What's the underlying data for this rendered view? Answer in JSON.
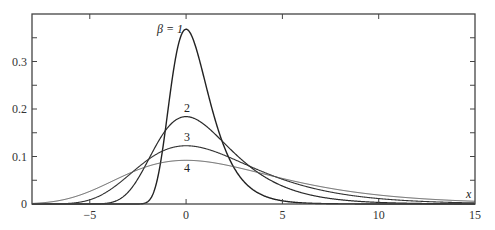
{
  "chart_data": {
    "type": "line",
    "title": "",
    "xlabel": "x",
    "ylabel": "",
    "xlim": [
      -8,
      15
    ],
    "ylim": [
      0,
      0.4
    ],
    "grid": false,
    "x_ticks": [
      -5,
      0,
      5,
      10,
      15
    ],
    "x_tick_labels": [
      "−5",
      "0",
      "5",
      "10",
      "15"
    ],
    "y_ticks": [
      0,
      0.1,
      0.2,
      0.3
    ],
    "y_tick_labels": [
      "0",
      "0.1",
      "0.2",
      "0.3"
    ],
    "y_minor_step": 0.05,
    "function": "Gumbel density f(x) = (1/β) exp(-(x/β) - exp(-x/β))",
    "series": [
      {
        "name": "β = 1",
        "beta": 1,
        "label": "β = 1",
        "peak": 0.368,
        "label_pos": [
          157,
          33
        ],
        "color": "#222222",
        "width": 1.4
      },
      {
        "name": "2",
        "beta": 2,
        "label": "2",
        "peak": 0.184,
        "label_pos": [
          184,
          112
        ],
        "color": "#2a2a2a",
        "width": 1.2
      },
      {
        "name": "3",
        "beta": 3,
        "label": "3",
        "peak": 0.123,
        "label_pos": [
          184,
          141
        ],
        "color": "#333333",
        "width": 1.1
      },
      {
        "name": "4",
        "beta": 4,
        "label": "4",
        "peak": 0.092,
        "label_pos": [
          184,
          172
        ],
        "color": "#555555",
        "width": 1.0
      }
    ]
  },
  "axis": {
    "x_label": "x"
  }
}
